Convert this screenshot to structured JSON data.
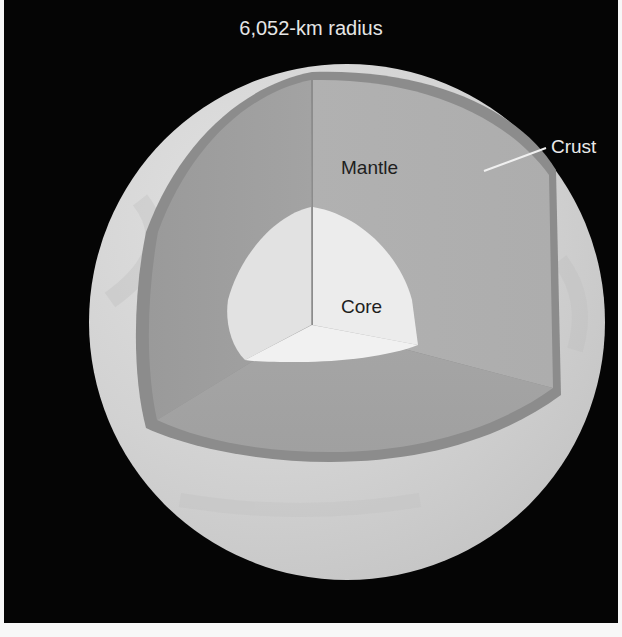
{
  "title": "6,052-km radius",
  "layers": {
    "crust": {
      "label": "Crust",
      "color": "#8a8a8a"
    },
    "mantle": {
      "label": "Mantle",
      "color": "#a7a7a7"
    },
    "core": {
      "label": "Core",
      "color": "#e9e9e9"
    }
  },
  "colors": {
    "background": "#050505",
    "surface": "#d4d4d4",
    "title_text": "#e6e6e6",
    "layer_text": "#1e1e1e"
  }
}
